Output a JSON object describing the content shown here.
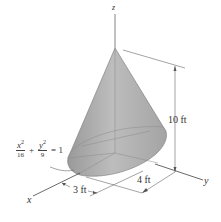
{
  "figure": {
    "type": "3D elliptic cone diagram",
    "colors": {
      "cone_fill_light": "#c8c8c8",
      "cone_fill_dark": "#8e8e8e",
      "line": "#555555",
      "text": "#333333"
    }
  },
  "axes": {
    "x_label": "x",
    "y_label": "y",
    "z_label": "z"
  },
  "dimensions": {
    "height": "10 ft",
    "semi_axis_x": "3 ft",
    "semi_axis_y": "4 ft"
  },
  "equation": {
    "term1_num": "x",
    "term1_exp": "2",
    "term1_den": "16",
    "plus": "+",
    "term2_num": "y",
    "term2_exp": "2",
    "term2_den": "9",
    "rhs": "= 1"
  }
}
